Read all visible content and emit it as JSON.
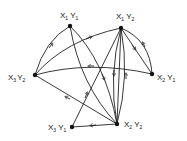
{
  "diagram": {
    "type": "directed-graph",
    "nodes": [
      {
        "id": "X1Y1",
        "main1": "X",
        "sub1": "1",
        "main2": "Y",
        "sub2": "1",
        "x": 70,
        "y": 26
      },
      {
        "id": "X1Y2",
        "main1": "X",
        "sub1": "1",
        "main2": "Y",
        "sub2": "2",
        "x": 121,
        "y": 28
      },
      {
        "id": "X3Y2",
        "main1": "X",
        "sub1": "3",
        "main2": "Y",
        "sub2": "2",
        "x": 35,
        "y": 75
      },
      {
        "id": "X2Y1",
        "main1": "X",
        "sub1": "2",
        "main2": "Y",
        "sub2": "1",
        "x": 152,
        "y": 74
      },
      {
        "id": "X3Y1",
        "main1": "X",
        "sub1": "3",
        "main2": "Y",
        "sub2": "1",
        "x": 72,
        "y": 127
      },
      {
        "id": "X2Y2",
        "main1": "X",
        "sub1": "2",
        "main2": "Y",
        "sub2": "2",
        "x": 117,
        "y": 124
      }
    ],
    "edges": [
      {
        "from": "X3Y2",
        "to": "X1Y1"
      },
      {
        "from": "X3Y2",
        "to": "X1Y2"
      },
      {
        "from": "X1Y1",
        "to": "X2Y2"
      },
      {
        "from": "X1Y1",
        "to": "X2Y2"
      },
      {
        "from": "X2Y1",
        "to": "X3Y2"
      },
      {
        "from": "X1Y2",
        "to": "X2Y1"
      },
      {
        "from": "X2Y1",
        "to": "X1Y2"
      },
      {
        "from": "X1Y2",
        "to": "X2Y2"
      },
      {
        "from": "X2Y2",
        "to": "X1Y2"
      },
      {
        "from": "X1Y2",
        "to": "X2Y2"
      },
      {
        "from": "X3Y1",
        "to": "X1Y2"
      },
      {
        "from": "X2Y2",
        "to": "X3Y2"
      },
      {
        "from": "X2Y2",
        "to": "X3Y1"
      }
    ]
  }
}
